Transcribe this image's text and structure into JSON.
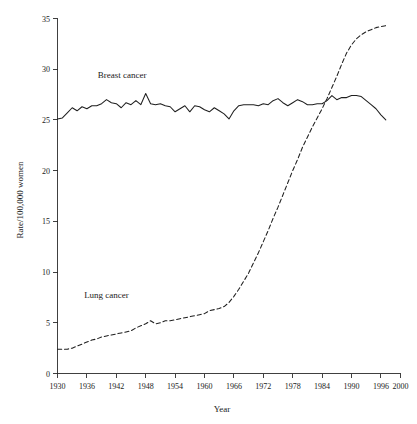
{
  "chart_data": {
    "type": "line",
    "title": "",
    "xlabel": "Year",
    "ylabel": "Rate/100,000 women",
    "xlim": [
      1930,
      2000
    ],
    "ylim": [
      0,
      35
    ],
    "grid": false,
    "legend_position": "inline-annotation",
    "x_ticks": [
      1930,
      1936,
      1942,
      1948,
      1954,
      1960,
      1966,
      1972,
      1978,
      1984,
      1990,
      1996,
      2000
    ],
    "x_tick_labels": [
      "1930",
      "1936",
      "1942",
      "1948",
      "1954",
      "1960",
      "1966",
      "1972",
      "1978",
      "1984",
      "1990",
      "1996",
      "2000"
    ],
    "y_ticks": [
      0,
      5,
      10,
      15,
      20,
      25,
      30,
      35
    ],
    "y_tick_labels": [
      "0",
      "5",
      "10",
      "15",
      "20",
      "25",
      "30",
      "35"
    ],
    "annotations": [
      {
        "text": "Breast cancer",
        "x": 1943.2,
        "y": 29.1
      },
      {
        "text": "Lung cancer",
        "x": 1940.0,
        "y": 7.4
      }
    ],
    "series": [
      {
        "name": "Breast cancer",
        "style": "solid",
        "color": "#1f1f1f",
        "x": [
          1930,
          1931,
          1932,
          1933,
          1934,
          1935,
          1936,
          1937,
          1938,
          1939,
          1940,
          1941,
          1942,
          1943,
          1944,
          1945,
          1946,
          1947,
          1948,
          1949,
          1950,
          1951,
          1952,
          1953,
          1954,
          1955,
          1956,
          1957,
          1958,
          1959,
          1960,
          1961,
          1962,
          1963,
          1964,
          1965,
          1966,
          1967,
          1968,
          1969,
          1970,
          1971,
          1972,
          1973,
          1974,
          1975,
          1976,
          1977,
          1978,
          1979,
          1980,
          1981,
          1982,
          1983,
          1984,
          1985,
          1986,
          1987,
          1988,
          1989,
          1990,
          1991,
          1992,
          1993,
          1994,
          1995,
          1996,
          1997
        ],
        "values": [
          25.1,
          25.2,
          25.7,
          26.2,
          25.9,
          26.3,
          26.1,
          26.4,
          26.4,
          26.6,
          27.0,
          26.7,
          26.6,
          26.2,
          26.7,
          26.5,
          26.9,
          26.5,
          27.6,
          26.6,
          26.5,
          26.6,
          26.4,
          26.3,
          25.8,
          26.1,
          26.4,
          25.8,
          26.4,
          26.3,
          26.0,
          25.8,
          26.2,
          25.9,
          25.6,
          25.1,
          25.9,
          26.4,
          26.5,
          26.5,
          26.5,
          26.4,
          26.6,
          26.5,
          26.9,
          27.1,
          26.7,
          26.4,
          26.7,
          27.0,
          26.8,
          26.5,
          26.5,
          26.6,
          26.6,
          26.9,
          27.4,
          27.0,
          27.2,
          27.2,
          27.4,
          27.4,
          27.3,
          26.9,
          26.5,
          26.1,
          25.5,
          25.0
        ]
      },
      {
        "name": "Lung cancer",
        "style": "dashed",
        "color": "#1f1f1f",
        "x": [
          1930,
          1931,
          1932,
          1933,
          1934,
          1935,
          1936,
          1937,
          1938,
          1939,
          1940,
          1941,
          1942,
          1943,
          1944,
          1945,
          1946,
          1947,
          1948,
          1949,
          1950,
          1951,
          1952,
          1953,
          1954,
          1955,
          1956,
          1957,
          1958,
          1959,
          1960,
          1961,
          1962,
          1963,
          1964,
          1965,
          1966,
          1967,
          1968,
          1969,
          1970,
          1971,
          1972,
          1973,
          1974,
          1975,
          1976,
          1977,
          1978,
          1979,
          1980,
          1981,
          1982,
          1983,
          1984,
          1985,
          1986,
          1987,
          1988,
          1989,
          1990,
          1991,
          1992,
          1993,
          1994,
          1995,
          1996,
          1997
        ],
        "values": [
          2.4,
          2.4,
          2.4,
          2.5,
          2.7,
          2.9,
          3.1,
          3.3,
          3.4,
          3.6,
          3.7,
          3.8,
          3.9,
          4.0,
          4.1,
          4.2,
          4.5,
          4.7,
          4.9,
          5.2,
          4.9,
          5.0,
          5.2,
          5.2,
          5.3,
          5.4,
          5.5,
          5.6,
          5.7,
          5.8,
          5.9,
          6.2,
          6.3,
          6.4,
          6.6,
          7.0,
          7.6,
          8.3,
          9.1,
          9.9,
          10.9,
          11.9,
          13.0,
          14.1,
          15.3,
          16.4,
          17.6,
          18.8,
          20.0,
          21.1,
          22.3,
          23.3,
          24.3,
          25.2,
          26.1,
          27.1,
          28.2,
          29.3,
          30.5,
          31.6,
          32.4,
          33.0,
          33.4,
          33.7,
          33.9,
          34.1,
          34.2,
          34.3
        ]
      }
    ]
  }
}
